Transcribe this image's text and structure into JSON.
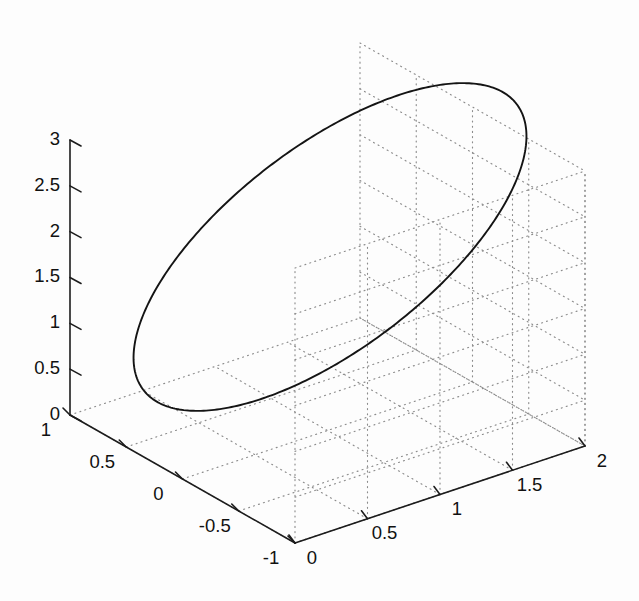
{
  "figure": {
    "title": "",
    "background_color": "#fdfdfd",
    "width": 639,
    "height": 601
  },
  "chart_data": {
    "type": "line",
    "plot_kind": "3d-parametric-curve",
    "title": "",
    "xlabel": "",
    "ylabel": "",
    "zlabel": "",
    "grid": true,
    "legend": null,
    "line_color": "#141414",
    "grid_color": "#8c8c8c",
    "axis_color": "#1c1c1c",
    "axes": {
      "x": {
        "label": "",
        "lim": [
          -1,
          1
        ],
        "ticks": [
          1,
          0.5,
          0,
          -0.5,
          -1
        ],
        "tick_labels": [
          "1",
          "0.5",
          "0",
          "-0.5",
          "-1"
        ]
      },
      "y": {
        "label": "",
        "lim": [
          0,
          2
        ],
        "ticks": [
          0,
          0.5,
          1,
          1.5,
          2
        ],
        "tick_labels": [
          "0",
          "0.5",
          "1",
          "1.5",
          "2"
        ]
      },
      "z": {
        "label": "",
        "lim": [
          0,
          3
        ],
        "ticks": [
          0,
          0.5,
          1,
          1.5,
          2,
          2.5,
          3
        ],
        "tick_labels": [
          "0",
          "0.5",
          "1",
          "1.5",
          "2",
          "2.5",
          "3"
        ]
      }
    },
    "series": [
      {
        "name": "ellipse",
        "description": "closed elliptical curve traced in 3D space",
        "style": "solid",
        "color": "#141414",
        "projected_extremes": {
          "leftmost_px": [
            143,
            305
          ],
          "rightmost_px": [
            512,
            180
          ],
          "topmost_px": [
            400,
            100
          ],
          "bottommost_px": [
            265,
            403
          ]
        }
      }
    ],
    "projection": {
      "origin_px": [
        70,
        415
      ],
      "x_axis_end_px": [
        295,
        543
      ],
      "y_axis_end_px": [
        585,
        446
      ],
      "z_axis_end_px": [
        70,
        140
      ]
    }
  }
}
